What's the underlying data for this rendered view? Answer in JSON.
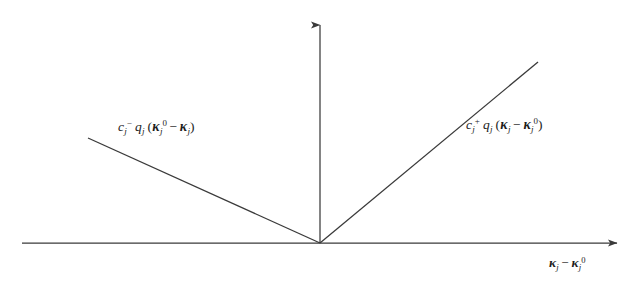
{
  "figure": {
    "background_color": "#ffffff",
    "line_color": "#3a3a3a",
    "text_color": "#1d1d1d"
  },
  "axes": {
    "x_axis": {
      "name": "horizontal-axis",
      "x_start": 22,
      "x_end": 625,
      "y": 243,
      "arrow": "right"
    },
    "y_axis": {
      "name": "vertical-axis",
      "x": 320,
      "y_start": 243,
      "y_end": 16,
      "arrow": "up"
    },
    "origin": {
      "x": 320,
      "y": 243
    }
  },
  "curve": {
    "type": "piecewise-linear-v",
    "vertex": {
      "x": 320,
      "y": 243
    },
    "left_arm": {
      "x1": 88,
      "y1": 138,
      "x2": 320,
      "y2": 243
    },
    "right_arm": {
      "x1": 320,
      "y2": 62,
      "x2": 538,
      "y1": 243
    }
  },
  "labels": {
    "left_branch": {
      "plain": "c_j^- q_j (k_j^0 - k_j)",
      "c": "c",
      "c_sub": "j",
      "c_sup": "−",
      "q": "q",
      "q_sub": "j",
      "open_paren": "(",
      "kappa1": "κ",
      "kappa1_sub": "j",
      "kappa1_sup": "0",
      "minus": "−",
      "kappa2": "κ",
      "kappa2_sub": "j",
      "close_paren": ")"
    },
    "right_branch": {
      "plain": "c_j^+ q_j (k_j - k_j^0)",
      "c": "c",
      "c_sub": "j",
      "c_sup": "+",
      "q": "q",
      "q_sub": "j",
      "open_paren": "(",
      "kappa1": "κ",
      "kappa1_sub": "j",
      "minus": "−",
      "kappa2": "κ",
      "kappa2_sub": "j",
      "kappa2_sup": "0",
      "close_paren": ")"
    },
    "x_axis_label": {
      "plain": "k_j - k_j^0",
      "kappa1": "κ",
      "kappa1_sub": "j",
      "minus": "−",
      "kappa2": "κ",
      "kappa2_sub": "j",
      "kappa2_sup": "0"
    }
  }
}
